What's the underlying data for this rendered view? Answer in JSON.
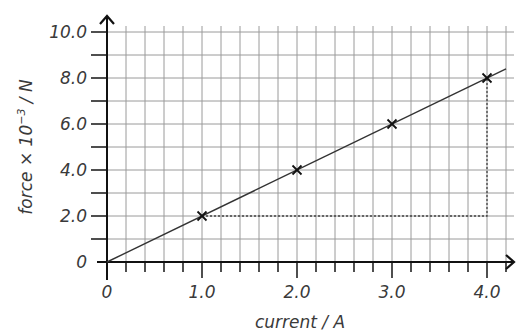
{
  "chart_data": {
    "type": "line",
    "title": "",
    "xlabel": "current / A",
    "ylabel": "force × 10⁻³ / N",
    "ylabel_parts": {
      "pre": "force × 10",
      "sup": "−3",
      "post": " / N"
    },
    "xlim": [
      0,
      4.2
    ],
    "ylim": [
      0,
      10.0
    ],
    "x_ticks": [
      "0",
      "1.0",
      "2.0",
      "3.0",
      "4.0"
    ],
    "y_ticks": [
      "0",
      "2.0",
      "4.0",
      "6.0",
      "8.0",
      "10.0"
    ],
    "grid": true,
    "legend": null,
    "series": [
      {
        "name": "measured points",
        "marker": "x",
        "x": [
          1.0,
          2.0,
          3.0,
          4.0
        ],
        "y": [
          2.0,
          4.0,
          6.0,
          8.0
        ]
      },
      {
        "name": "best-fit line",
        "style": "solid",
        "x": [
          0,
          4.2
        ],
        "y": [
          0,
          8.4
        ]
      }
    ],
    "annotations": [
      {
        "type": "gradient-triangle",
        "style": "dotted",
        "from": [
          1.0,
          2.0
        ],
        "corner": [
          4.0,
          2.0
        ],
        "to": [
          4.0,
          8.0
        ]
      }
    ]
  }
}
